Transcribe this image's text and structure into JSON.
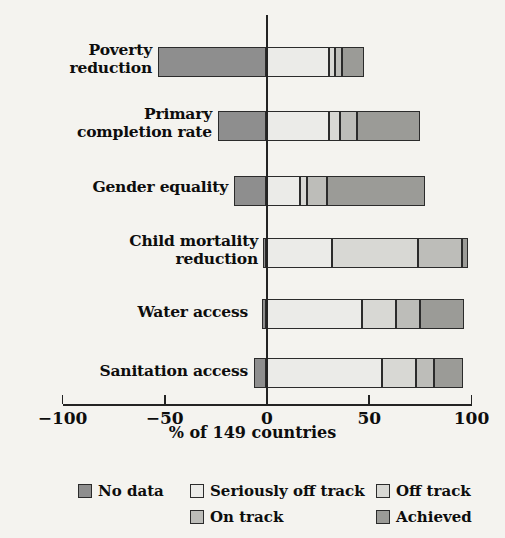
{
  "chart_data": {
    "type": "bar",
    "orientation": "horizontal",
    "stacked": true,
    "diverging": true,
    "title": "",
    "xlabel": "% of 149 countries",
    "ylabel": "",
    "xlim": [
      -100,
      100
    ],
    "xticks": [
      -100,
      -50,
      0,
      50,
      100
    ],
    "xticklabels": [
      "−100",
      "−50",
      "0",
      "50",
      "100"
    ],
    "grid": false,
    "legend_position": "bottom",
    "categories": [
      "Poverty reduction",
      "Primary completion rate",
      "Gender equality",
      "Child mortality reduction",
      "Water access",
      "Sanitation access"
    ],
    "series": [
      {
        "name": "No data",
        "color": "#8e8e8e",
        "values": [
          -53.0,
          -23.5,
          -16.0,
          -1.5,
          -2.0,
          -6.0
        ]
      },
      {
        "name": "Seriously off track",
        "color": "#ebebe8",
        "values": [
          30.5,
          30.5,
          16.5,
          32.0,
          47.0,
          56.5
        ]
      },
      {
        "name": "Off track",
        "color": "#d8d8d4",
        "values": [
          3.0,
          5.5,
          3.5,
          42.0,
          16.5,
          16.5
        ]
      },
      {
        "name": "On track",
        "color": "#bdbdb9",
        "values": [
          3.5,
          8.5,
          9.5,
          21.5,
          11.5,
          9.0
        ]
      },
      {
        "name": "Achieved",
        "color": "#9b9b97",
        "values": [
          11.0,
          30.5,
          48.0,
          3.0,
          21.5,
          14.0
        ]
      }
    ],
    "row_totals_positive": [
      48.0,
      75.0,
      77.5,
      98.5,
      96.5,
      96.0
    ]
  },
  "axis": {
    "title": "% of 149 countries",
    "ticks": [
      {
        "value": -100,
        "label": "−100"
      },
      {
        "value": -50,
        "label": "−50"
      },
      {
        "value": 0,
        "label": "0"
      },
      {
        "value": 50,
        "label": "50"
      },
      {
        "value": 100,
        "label": "100"
      }
    ]
  },
  "categories": [
    {
      "line1": "Poverty",
      "line2": "reduction"
    },
    {
      "line1": "Primary",
      "line2": "completion rate"
    },
    {
      "line1": "Gender equality",
      "line2": ""
    },
    {
      "line1": "Child mortality",
      "line2": "reduction"
    },
    {
      "line1": "Water access",
      "line2": ""
    },
    {
      "line1": "Sanitation access",
      "line2": ""
    }
  ],
  "legend": {
    "row1": [
      {
        "label": "No data",
        "color": "#8e8e8e"
      },
      {
        "label": "Seriously off track",
        "color": "#ebebe8"
      },
      {
        "label": "Off track",
        "color": "#d8d8d4"
      }
    ],
    "row2": [
      {
        "label": "On track",
        "color": "#bdbdb9"
      },
      {
        "label": "Achieved",
        "color": "#9b9b97"
      }
    ]
  }
}
